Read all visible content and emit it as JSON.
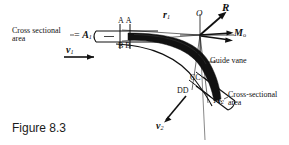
{
  "figure": {
    "caption": "Figure 8.3"
  },
  "labels": {
    "cross_sectional_area_1_line1": "Cross sectional",
    "cross_sectional_area_1_line2": "area",
    "area_1_equals": "= ",
    "area_1_symbol": "A",
    "area_1_sub": "1",
    "velocity_1_symbol": "v",
    "velocity_1_sub": "1",
    "section_a": "A",
    "section_a_prime": "A",
    "section_b": "B",
    "section_b_prime": "B",
    "radius_1_symbol": "r",
    "radius_1_sub": "1",
    "radius_2_symbol": "r",
    "radius_2_sub": "2",
    "origin_point": "O",
    "resultant_force": "R",
    "moment_symbol": "M",
    "moment_sub": "o",
    "guide_vane": "Guide vane",
    "section_c": "C",
    "section_c_prime": "C",
    "section_d": "D",
    "section_d_prime": "D",
    "area_2_symbol": "A",
    "area_2_sub": "2",
    "cross_sectional_area_2_line1": "Cross-sectional",
    "cross_sectional_area_2_line2": "area",
    "velocity_2_symbol": "v",
    "velocity_2_sub": "2"
  },
  "colors": {
    "ink": "#111111",
    "vane_fill": "#111111",
    "background": "#ffffff"
  }
}
